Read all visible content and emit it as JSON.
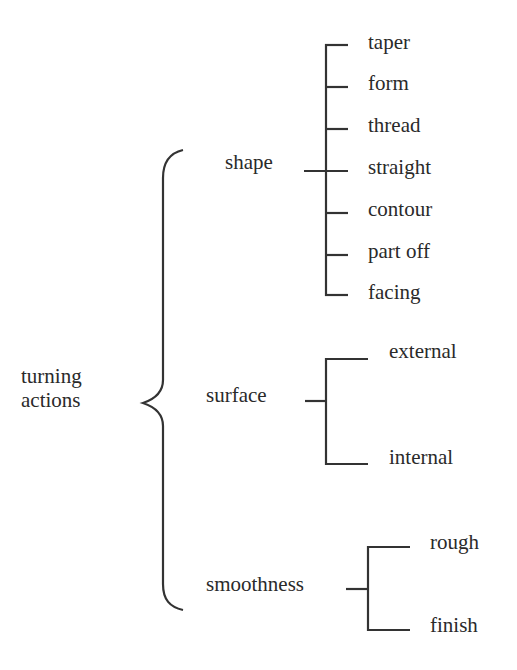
{
  "diagram": {
    "type": "tree-classification",
    "root": {
      "label_line1": "turning",
      "label_line2": "actions"
    },
    "branches": [
      {
        "label": "shape",
        "children": [
          "taper",
          "form",
          "thread",
          "straight",
          "contour",
          "part off",
          "facing"
        ]
      },
      {
        "label": "surface",
        "children": [
          "external",
          "internal"
        ]
      },
      {
        "label": "smoothness",
        "children": [
          "rough",
          "finish"
        ]
      }
    ]
  }
}
